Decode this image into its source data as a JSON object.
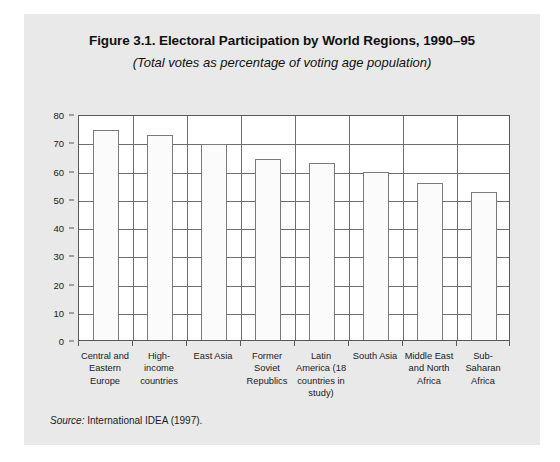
{
  "figure": {
    "title": "Figure 3.1. Electoral Participation by World Regions, 1990–95",
    "subtitle": "(Total votes as percentage of voting age population)",
    "source_label": "Source:",
    "source_text": " International IDEA (1997)."
  },
  "chart_data": {
    "type": "bar",
    "title": "Figure 3.1. Electoral Participation by World Regions, 1990–95",
    "subtitle": "(Total votes as percentage of voting age population)",
    "xlabel": "",
    "ylabel": "",
    "ylim": [
      0,
      80
    ],
    "ytick_step": 10,
    "yticks": [
      0,
      10,
      20,
      30,
      40,
      50,
      60,
      70,
      80
    ],
    "grid": true,
    "legend": false,
    "categories": [
      "Central and Eastern Europe",
      "High-income countries",
      "East Asia",
      "Former Soviet Republics",
      "Latin America (18 countries in study)",
      "South Asia",
      "Middle East and North Africa",
      "Sub-Saharan Africa"
    ],
    "category_lines": [
      [
        "Central and",
        "Eastern",
        "Europe"
      ],
      [
        "High-income",
        "countries"
      ],
      [
        "East Asia"
      ],
      [
        "Former",
        "Soviet",
        "Republics"
      ],
      [
        "Latin",
        "America (18",
        "countries in",
        "study)"
      ],
      [
        "South Asia"
      ],
      [
        "Middle East",
        "and North",
        "Africa"
      ],
      [
        "Sub-Saharan",
        "Africa"
      ]
    ],
    "values": [
      74.5,
      72.5,
      69.5,
      64.0,
      62.5,
      59.5,
      55.5,
      52.5
    ],
    "bar_fill": "#fbfbfb",
    "bar_edge": "#7a7b7d",
    "grid_color": "#6d6e71",
    "panel_color": "#e9e9e9",
    "plot_bg": "#ffffff"
  }
}
